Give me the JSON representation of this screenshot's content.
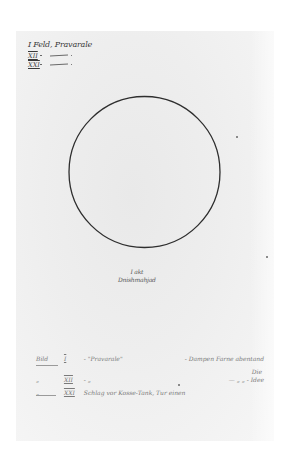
{
  "document": {
    "type": "handwritten manuscript page",
    "header_note": "I Feld, Pravarale",
    "roman_list": [
      {
        "numeral": "XII",
        "text": "—"
      },
      {
        "numeral": "XXI",
        "text": "—"
      }
    ],
    "figure": {
      "shape": "circle",
      "caption_line1": "I akt",
      "caption_line2": "Dnishmahjad"
    },
    "notes": [
      {
        "label": "Bild",
        "numeral": "I",
        "text": "- \"Pravarale\"",
        "right": "- Dampen Farne abentand"
      },
      {
        "sub": "Die"
      },
      {
        "label": "„",
        "numeral": "XII",
        "text": "-      „",
        "right": "—    „    „    - Idee"
      },
      {
        "label": "„",
        "numeral": "XXI",
        "text": "Schlag vor Kosse-Tank, Tur einen"
      }
    ]
  },
  "colors": {
    "paper": "#eeeeee",
    "background": "#ffffff",
    "ink": "#2e2e2e",
    "pencil": "#7a7a7a"
  }
}
